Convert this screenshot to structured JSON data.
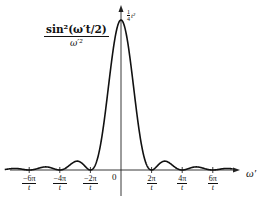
{
  "chart_data": {
    "type": "line",
    "title": "",
    "function": "sin^2(ω' t/2) / ω'^2",
    "ylabel": {
      "numerator": "sin²(ω′t/2)",
      "denominator": "ω′²"
    },
    "xlabel": "ω′",
    "peak_label": {
      "coef_num": "1",
      "coef_den": "4",
      "var": "t²"
    },
    "origin_label": "0",
    "x_ticks": [
      {
        "num": "−6π",
        "den": "t",
        "value": -6
      },
      {
        "num": "−4π",
        "den": "t",
        "value": -4
      },
      {
        "num": "−2π",
        "den": "t",
        "value": -2
      },
      {
        "num": "2π",
        "den": "t",
        "value": 2
      },
      {
        "num": "4π",
        "den": "t",
        "value": 4
      },
      {
        "num": "6π",
        "den": "t",
        "value": 6
      }
    ],
    "x_units": "π/t",
    "xlim": [
      -7.6,
      7.3
    ],
    "ylim": [
      0,
      1.0
    ],
    "peak_value_normalized": 1.0,
    "zeros": [
      -6,
      -4,
      -2,
      2,
      4,
      6
    ],
    "side_lobes_normalized": [
      {
        "x": -5,
        "y": 0.016
      },
      {
        "x": -3,
        "y": 0.045
      },
      {
        "x": 3,
        "y": 0.045
      },
      {
        "x": 5,
        "y": 0.016
      }
    ],
    "grid": false,
    "legend": null,
    "line_color": "#111111"
  }
}
